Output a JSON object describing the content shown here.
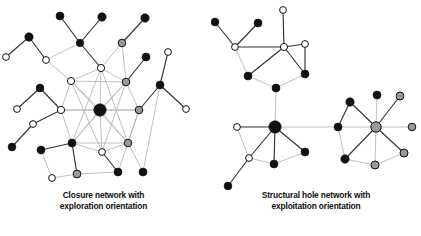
{
  "figure": {
    "background": "#ffffff",
    "panels": [
      {
        "id": "left",
        "caption_line1": "Closure network with",
        "caption_line2": "exploration orientation"
      },
      {
        "id": "right",
        "caption_line1": "Structural hole network with",
        "caption_line2": "exploitation orientation"
      }
    ]
  },
  "chart_data": {
    "type": "diagram",
    "subtype": "node-link-network",
    "title": "",
    "node_styles": {
      "black": "#111111",
      "gray": "#9a9a9a",
      "white": "#ffffff",
      "stroke": "#111111"
    },
    "edge_styles": {
      "dark": "#333333",
      "light": "#b0b0b0"
    },
    "panels": [
      {
        "id": "left",
        "label": "Closure network with exploration orientation",
        "nodes": [
          {
            "id": "L-hub",
            "x": 100,
            "y": 110,
            "r": 6.2,
            "fill": "black"
          },
          {
            "id": "L-c-top",
            "x": 101,
            "y": 68,
            "r": 3.6,
            "fill": "white"
          },
          {
            "id": "L-c-ul",
            "x": 71,
            "y": 81,
            "r": 3.6,
            "fill": "white"
          },
          {
            "id": "L-c-ur",
            "x": 126,
            "y": 82,
            "r": 3.8,
            "fill": "gray"
          },
          {
            "id": "L-c-l",
            "x": 61,
            "y": 110,
            "r": 3.6,
            "fill": "white"
          },
          {
            "id": "L-c-r",
            "x": 139,
            "y": 110,
            "r": 3.8,
            "fill": "gray"
          },
          {
            "id": "L-c-ll",
            "x": 72,
            "y": 143,
            "r": 4.0,
            "fill": "black"
          },
          {
            "id": "L-c-lr",
            "x": 128,
            "y": 143,
            "r": 3.8,
            "fill": "gray"
          },
          {
            "id": "L-c-bot",
            "x": 102,
            "y": 152,
            "r": 3.4,
            "fill": "white"
          },
          {
            "id": "L-a1",
            "x": 80,
            "y": 43,
            "r": 3.8,
            "fill": "black"
          },
          {
            "id": "L-a2",
            "x": 60,
            "y": 16,
            "r": 4.0,
            "fill": "black"
          },
          {
            "id": "L-a3",
            "x": 102,
            "y": 17,
            "r": 4.2,
            "fill": "black"
          },
          {
            "id": "L-b1",
            "x": 46,
            "y": 60,
            "r": 3.4,
            "fill": "white"
          },
          {
            "id": "L-b2",
            "x": 29,
            "y": 37,
            "r": 4.2,
            "fill": "black"
          },
          {
            "id": "L-b3",
            "x": 6,
            "y": 57,
            "r": 3.4,
            "fill": "white"
          },
          {
            "id": "L-d1",
            "x": 122,
            "y": 43,
            "r": 3.8,
            "fill": "gray"
          },
          {
            "id": "L-d2",
            "x": 145,
            "y": 18,
            "r": 4.2,
            "fill": "black"
          },
          {
            "id": "L-e1",
            "x": 146,
            "y": 57,
            "r": 4.0,
            "fill": "black"
          },
          {
            "id": "L-f1",
            "x": 40,
            "y": 88,
            "r": 3.9,
            "fill": "black"
          },
          {
            "id": "L-f2",
            "x": 17,
            "y": 109,
            "r": 3.4,
            "fill": "white"
          },
          {
            "id": "L-g1",
            "x": 33,
            "y": 124,
            "r": 3.4,
            "fill": "white"
          },
          {
            "id": "L-g2",
            "x": 12,
            "y": 147,
            "r": 3.9,
            "fill": "black"
          },
          {
            "id": "L-h1",
            "x": 41,
            "y": 150,
            "r": 4.0,
            "fill": "black"
          },
          {
            "id": "L-h2",
            "x": 52,
            "y": 178,
            "r": 3.4,
            "fill": "white"
          },
          {
            "id": "L-i1",
            "x": 77,
            "y": 174,
            "r": 3.9,
            "fill": "gray"
          },
          {
            "id": "L-i2",
            "x": 118,
            "y": 172,
            "r": 4.0,
            "fill": "black"
          },
          {
            "id": "L-j1",
            "x": 160,
            "y": 85,
            "r": 4.0,
            "fill": "black"
          },
          {
            "id": "L-j2",
            "x": 168,
            "y": 52,
            "r": 3.4,
            "fill": "white"
          },
          {
            "id": "L-j3",
            "x": 186,
            "y": 109,
            "r": 3.4,
            "fill": "white"
          },
          {
            "id": "L-j4",
            "x": 143,
            "y": 172,
            "r": 4.0,
            "fill": "black"
          }
        ],
        "edges": [
          [
            "L-hub",
            "L-c-top",
            "light"
          ],
          [
            "L-hub",
            "L-c-ul",
            "light"
          ],
          [
            "L-hub",
            "L-c-ur",
            "light"
          ],
          [
            "L-hub",
            "L-c-l",
            "light"
          ],
          [
            "L-hub",
            "L-c-r",
            "light"
          ],
          [
            "L-hub",
            "L-c-ll",
            "light"
          ],
          [
            "L-hub",
            "L-c-lr",
            "light"
          ],
          [
            "L-hub",
            "L-c-bot",
            "light"
          ],
          [
            "L-c-top",
            "L-c-ul",
            "light"
          ],
          [
            "L-c-top",
            "L-c-ur",
            "light"
          ],
          [
            "L-c-ul",
            "L-c-l",
            "light"
          ],
          [
            "L-c-ur",
            "L-c-r",
            "light"
          ],
          [
            "L-c-l",
            "L-c-ll",
            "light"
          ],
          [
            "L-c-r",
            "L-c-lr",
            "light"
          ],
          [
            "L-c-ll",
            "L-c-bot",
            "light"
          ],
          [
            "L-c-lr",
            "L-c-bot",
            "light"
          ],
          [
            "L-c-ul",
            "L-c-ur",
            "light"
          ],
          [
            "L-c-ul",
            "L-c-lr",
            "light"
          ],
          [
            "L-c-ur",
            "L-c-ll",
            "light"
          ],
          [
            "L-c-l",
            "L-c-r",
            "light"
          ],
          [
            "L-c-top",
            "L-c-ll",
            "light"
          ],
          [
            "L-c-top",
            "L-c-lr",
            "light"
          ],
          [
            "L-c-ll",
            "L-c-lr",
            "light"
          ],
          [
            "L-c-ul",
            "L-c-bot",
            "light"
          ],
          [
            "L-c-ur",
            "L-c-bot",
            "light"
          ],
          [
            "L-c-top",
            "L-a1",
            "dark"
          ],
          [
            "L-a1",
            "L-a2",
            "dark"
          ],
          [
            "L-a1",
            "L-a3",
            "dark"
          ],
          [
            "L-a1",
            "L-b1",
            "light"
          ],
          [
            "L-b1",
            "L-b2",
            "dark"
          ],
          [
            "L-b2",
            "L-b3",
            "dark"
          ],
          [
            "L-b1",
            "L-c-ul",
            "light"
          ],
          [
            "L-c-top",
            "L-d1",
            "light"
          ],
          [
            "L-d1",
            "L-d2",
            "dark"
          ],
          [
            "L-c-ur",
            "L-d1",
            "light"
          ],
          [
            "L-c-ur",
            "L-e1",
            "dark"
          ],
          [
            "L-c-l",
            "L-f1",
            "dark"
          ],
          [
            "L-f1",
            "L-f2",
            "dark"
          ],
          [
            "L-c-l",
            "L-g1",
            "dark"
          ],
          [
            "L-g1",
            "L-g2",
            "dark"
          ],
          [
            "L-c-ll",
            "L-h1",
            "dark"
          ],
          [
            "L-h1",
            "L-h2",
            "light"
          ],
          [
            "L-h2",
            "L-i1",
            "light"
          ],
          [
            "L-c-ll",
            "L-i1",
            "dark"
          ],
          [
            "L-i1",
            "L-i2",
            "light"
          ],
          [
            "L-c-bot",
            "L-i2",
            "dark"
          ],
          [
            "L-c-lr",
            "L-i2",
            "light"
          ],
          [
            "L-c-r",
            "L-j1",
            "dark"
          ],
          [
            "L-j1",
            "L-j2",
            "dark"
          ],
          [
            "L-j1",
            "L-j3",
            "dark"
          ],
          [
            "L-j1",
            "L-j4",
            "light"
          ],
          [
            "L-c-lr",
            "L-j4",
            "light"
          ],
          [
            "L-c-r",
            "L-c-lr",
            "light"
          ]
        ]
      },
      {
        "id": "right",
        "label": "Structural hole network with exploitation orientation",
        "nodes": [
          {
            "id": "R-hub",
            "x": 275,
            "y": 127,
            "r": 6.2,
            "fill": "black"
          },
          {
            "id": "R-hub2",
            "x": 376,
            "y": 127,
            "r": 5.2,
            "fill": "gray"
          },
          {
            "id": "R-t-w1",
            "x": 235,
            "y": 47,
            "r": 3.4,
            "fill": "white"
          },
          {
            "id": "R-t-w2",
            "x": 284,
            "y": 47,
            "r": 3.6,
            "fill": "white"
          },
          {
            "id": "R-t-w3",
            "x": 283,
            "y": 10,
            "r": 3.4,
            "fill": "white"
          },
          {
            "id": "R-t-w4",
            "x": 305,
            "y": 44,
            "r": 3.4,
            "fill": "white"
          },
          {
            "id": "R-t-b1",
            "x": 215,
            "y": 22,
            "r": 3.9,
            "fill": "black"
          },
          {
            "id": "R-t-b2",
            "x": 258,
            "y": 23,
            "r": 4.0,
            "fill": "black"
          },
          {
            "id": "R-t-b3",
            "x": 248,
            "y": 76,
            "r": 4.0,
            "fill": "black"
          },
          {
            "id": "R-t-b4",
            "x": 305,
            "y": 74,
            "r": 4.0,
            "fill": "black"
          },
          {
            "id": "R-t-b5",
            "x": 276,
            "y": 88,
            "r": 4.0,
            "fill": "black"
          },
          {
            "id": "R-lw1",
            "x": 237,
            "y": 127,
            "r": 3.4,
            "fill": "white"
          },
          {
            "id": "R-lw2",
            "x": 249,
            "y": 158,
            "r": 3.4,
            "fill": "white"
          },
          {
            "id": "R-lb1",
            "x": 274,
            "y": 164,
            "r": 4.0,
            "fill": "black"
          },
          {
            "id": "R-lb2",
            "x": 305,
            "y": 152,
            "r": 4.0,
            "fill": "black"
          },
          {
            "id": "R-lb3",
            "x": 228,
            "y": 186,
            "r": 3.9,
            "fill": "black"
          },
          {
            "id": "R-mb1",
            "x": 338,
            "y": 127,
            "r": 4.0,
            "fill": "black"
          },
          {
            "id": "R-mb2",
            "x": 350,
            "y": 102,
            "r": 4.2,
            "fill": "black"
          },
          {
            "id": "R-mb3",
            "x": 345,
            "y": 159,
            "r": 4.2,
            "fill": "black"
          },
          {
            "id": "R-rb1",
            "x": 377,
            "y": 95,
            "r": 4.0,
            "fill": "black"
          },
          {
            "id": "R-rg1",
            "x": 400,
            "y": 96,
            "r": 4.0,
            "fill": "gray"
          },
          {
            "id": "R-rg2",
            "x": 412,
            "y": 127,
            "r": 3.8,
            "fill": "gray"
          },
          {
            "id": "R-rg3",
            "x": 404,
            "y": 153,
            "r": 4.0,
            "fill": "gray"
          },
          {
            "id": "R-rg4",
            "x": 375,
            "y": 165,
            "r": 4.0,
            "fill": "gray"
          }
        ],
        "edges": [
          [
            "R-t-w1",
            "R-t-b1",
            "dark"
          ],
          [
            "R-t-w1",
            "R-t-b2",
            "dark"
          ],
          [
            "R-t-w1",
            "R-t-w2",
            "dark"
          ],
          [
            "R-t-w1",
            "R-t-b3",
            "light"
          ],
          [
            "R-t-w2",
            "R-t-w3",
            "dark"
          ],
          [
            "R-t-w2",
            "R-t-w4",
            "dark"
          ],
          [
            "R-t-w4",
            "R-t-b4",
            "dark"
          ],
          [
            "R-t-w2",
            "R-t-b3",
            "dark"
          ],
          [
            "R-t-w2",
            "R-t-b4",
            "dark"
          ],
          [
            "R-t-b3",
            "R-t-b5",
            "light"
          ],
          [
            "R-t-b5",
            "R-t-b4",
            "light"
          ],
          [
            "R-t-b5",
            "R-hub",
            "light"
          ],
          [
            "R-hub",
            "R-lw1",
            "dark"
          ],
          [
            "R-hub",
            "R-lw2",
            "dark"
          ],
          [
            "R-hub",
            "R-lb1",
            "dark"
          ],
          [
            "R-hub",
            "R-lb2",
            "dark"
          ],
          [
            "R-lw1",
            "R-lw2",
            "light"
          ],
          [
            "R-lw2",
            "R-lb1",
            "light"
          ],
          [
            "R-lb1",
            "R-lb2",
            "light"
          ],
          [
            "R-lw2",
            "R-lb3",
            "dark"
          ],
          [
            "R-hub",
            "R-mb1",
            "light"
          ],
          [
            "R-mb1",
            "R-mb2",
            "dark"
          ],
          [
            "R-mb1",
            "R-mb3",
            "light"
          ],
          [
            "R-mb2",
            "R-hub2",
            "dark"
          ],
          [
            "R-mb3",
            "R-hub2",
            "dark"
          ],
          [
            "R-mb1",
            "R-hub2",
            "light"
          ],
          [
            "R-hub2",
            "R-rb1",
            "light"
          ],
          [
            "R-hub2",
            "R-rg1",
            "dark"
          ],
          [
            "R-hub2",
            "R-rg2",
            "light"
          ],
          [
            "R-hub2",
            "R-rg3",
            "dark"
          ],
          [
            "R-hub2",
            "R-rg4",
            "light"
          ],
          [
            "R-mb3",
            "R-rg4",
            "light"
          ],
          [
            "R-rg4",
            "R-rg3",
            "light"
          ]
        ]
      }
    ]
  }
}
